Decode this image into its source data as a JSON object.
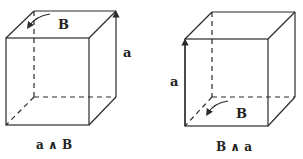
{
  "diagrams": [
    {
      "name": "a wedge B",
      "caption": "a ∧ B",
      "labels": {
        "bivector": "B",
        "vector": "a"
      },
      "geometry": {
        "front": {
          "x1": 6,
          "y1": 38,
          "x2": 89,
          "y2": 125
        },
        "back": {
          "x1": 34,
          "y1": 11,
          "x2": 116,
          "y2": 97
        },
        "vector_edge": "back-right vertical edge, arrow pointing up",
        "bivector_face": "top face, curved arrow near back-left corner"
      }
    },
    {
      "name": "B wedge a",
      "caption": "B ∧ a",
      "labels": {
        "bivector": "B",
        "vector": "a"
      },
      "geometry": {
        "front": {
          "x1": 185,
          "y1": 39,
          "x2": 268,
          "y2": 126
        },
        "back": {
          "x1": 212,
          "y1": 12,
          "x2": 295,
          "y2": 97
        },
        "vector_edge": "front-left vertical edge, arrow pointing up",
        "bivector_face": "bottom face, curved arrow near back-left corner"
      }
    }
  ]
}
